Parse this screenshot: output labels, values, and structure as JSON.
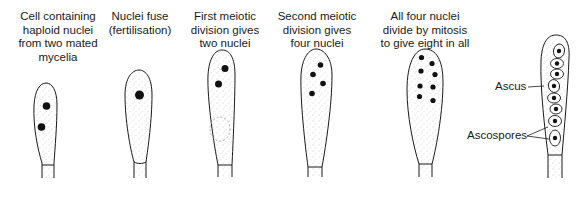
{
  "figure": {
    "stages": [
      {
        "caption": [
          "Cell containing",
          "haploid nuclei",
          "from two mated",
          "mycelia"
        ],
        "nuclei_count": 2
      },
      {
        "caption": [
          "Nuclei fuse",
          "(fertilisation)"
        ],
        "nuclei_count": 1
      },
      {
        "caption": [
          "First meiotic",
          "division gives",
          "two nuclei"
        ],
        "nuclei_count": 2
      },
      {
        "caption": [
          "Second meiotic",
          "division gives",
          "four nuclei"
        ],
        "nuclei_count": 4
      },
      {
        "caption": [
          "All four nuclei",
          "divide by mitosis",
          "to give eight in all"
        ],
        "nuclei_count": 8
      },
      {
        "caption": [],
        "nuclei_count": 8
      }
    ],
    "labels": {
      "ascus": "Ascus",
      "ascospores": "Ascospores"
    },
    "colors": {
      "line": "#1a1a1a",
      "nucleus": "#111111",
      "stipple": "#9a9a9a",
      "background": "#ffffff"
    }
  }
}
